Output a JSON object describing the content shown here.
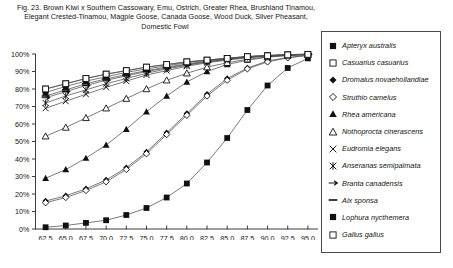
{
  "caption": {
    "line1": "Fig. 23.  Brown Kiwi x Southern Cassowary, Emu, Ostrich, Greater Rhea, Brushland Tinamou,",
    "line2": "Elegant Crested-Tinamou, Magpie Goose, Canada Goose, Wood Duck, Silver Pheasant,",
    "line3": "Domestic Fowl"
  },
  "colors": {
    "ink": "#141414",
    "axis": "#3d3d3d",
    "line": "#4f4f4f",
    "marker_fill": "#101010",
    "marker_open": "#ffffff",
    "legend_border": "#4a4a4a"
  },
  "chart_data": {
    "type": "line",
    "title": "Fig. 23.  Brown Kiwi x Southern Cassowary, Emu, Ostrich, Greater Rhea, Brushland Tinamou, Elegant Crested-Tinamou, Magpie Goose, Canada Goose, Wood Duck, Silver Pheasant, Domestic Fowl",
    "xlabel": "",
    "ylabel": "",
    "xlim": [
      61.25,
      96.25
    ],
    "ylim": [
      0,
      100
    ],
    "grid": false,
    "legend_position": "right",
    "y_tick_labels": [
      "0%",
      "10%",
      "20%",
      "30%",
      "40%",
      "50%",
      "60%",
      "70%",
      "80%",
      "90%",
      "100%"
    ],
    "y_ticks": [
      0,
      10,
      20,
      30,
      40,
      50,
      60,
      70,
      80,
      90,
      100
    ],
    "x_tick_labels": [
      "62.5",
      "65.0",
      "67.5",
      "70.0",
      "72.5",
      "75.0",
      "77.5",
      "80.0",
      "82.5",
      "85.0",
      "87.5",
      "90.0",
      "92.5",
      "95.0"
    ],
    "x": [
      62.5,
      65.0,
      67.5,
      70.0,
      72.5,
      75.0,
      77.5,
      80.0,
      82.5,
      85.0,
      87.5,
      90.0,
      92.5,
      95.0
    ],
    "series": [
      {
        "name": "Apteryx australis",
        "marker": "filled-square",
        "values": [
          1,
          2,
          3.5,
          5,
          8,
          12,
          18,
          26,
          38,
          52,
          68,
          82,
          92,
          97.5
        ]
      },
      {
        "name": "Casuarius casuarius",
        "marker": "open-square",
        "values": [
          80,
          83,
          86,
          88.5,
          90.5,
          92.5,
          94,
          95.5,
          96.5,
          97.5,
          98.5,
          99,
          99.5,
          99.8
        ]
      },
      {
        "name": "Dromaius novaehollandiae",
        "marker": "filled-diamond",
        "values": [
          16,
          19,
          23,
          28,
          35,
          44,
          55,
          66,
          77,
          86,
          92,
          96,
          98,
          99.3
        ]
      },
      {
        "name": "Struthio camelus",
        "marker": "open-diamond",
        "values": [
          15,
          18,
          22,
          27,
          34,
          43,
          54,
          65,
          76,
          85,
          91.5,
          95.5,
          97.8,
          99.2
        ]
      },
      {
        "name": "Rhea americana",
        "marker": "filled-triangle",
        "values": [
          29,
          34,
          40.5,
          48,
          57,
          67,
          76,
          84,
          90,
          94,
          96.5,
          98.2,
          99.2,
          99.6
        ]
      },
      {
        "name": "Nothoprocta cinerascens",
        "marker": "open-triangle",
        "values": [
          53,
          58,
          63.5,
          69,
          74.5,
          80,
          85,
          89,
          92.5,
          95,
          97,
          98.3,
          99.2,
          99.6
        ]
      },
      {
        "name": "Eudromia elegans",
        "marker": "x-cross",
        "values": [
          69,
          73,
          77,
          81,
          84.5,
          88,
          90.5,
          93,
          95,
          96.5,
          97.8,
          98.7,
          99.3,
          99.7
        ]
      },
      {
        "name": "Anseranas semipalmata",
        "marker": "star-cross",
        "values": [
          72,
          76,
          79.5,
          83,
          86,
          89,
          91.5,
          93.5,
          95.5,
          97,
          98.2,
          99,
          99.5,
          99.8
        ]
      },
      {
        "name": "Branta canadensis",
        "marker": "dash-arrow",
        "values": [
          75,
          78.5,
          82,
          85,
          87.5,
          90,
          92,
          94,
          95.5,
          97,
          98.2,
          99,
          99.5,
          99.8
        ]
      },
      {
        "name": "Aix sponsa",
        "marker": "dash",
        "values": [
          76,
          79.5,
          83,
          85.8,
          88.2,
          90.5,
          92.5,
          94.3,
          96,
          97.3,
          98.4,
          99.1,
          99.6,
          99.9
        ]
      },
      {
        "name": "Lophura nycthemera",
        "marker": "filled-square",
        "values": [
          78,
          81.5,
          84.5,
          87,
          89.5,
          91.5,
          93.3,
          95,
          96.5,
          97.6,
          98.6,
          99.2,
          99.6,
          99.9
        ]
      },
      {
        "name": "Gallus gallus",
        "marker": "open-square",
        "values": [
          80,
          83,
          86,
          88.5,
          90.5,
          92.5,
          94,
          95.5,
          96.5,
          97.5,
          98.5,
          99,
          99.5,
          99.8
        ]
      }
    ],
    "legend_entries": [
      {
        "label": "Apteryx australis",
        "marker": "filled-square"
      },
      {
        "label": "Casuarius casuarius",
        "marker": "open-square"
      },
      {
        "label": "Dromaius novaehollandiae",
        "marker": "filled-diamond"
      },
      {
        "label": "Struthio camelus",
        "marker": "open-diamond"
      },
      {
        "label": "Rhea americana",
        "marker": "filled-triangle"
      },
      {
        "label": "Nothoprocta cinerascens",
        "marker": "open-triangle"
      },
      {
        "label": "Eudromia elegans",
        "marker": "x-cross"
      },
      {
        "label": "Anseranas semipalmata",
        "marker": "star-cross"
      },
      {
        "label": "Branta canadensis",
        "marker": "dash-arrow"
      },
      {
        "label": "Aix sponsa",
        "marker": "dash"
      },
      {
        "label": "Lophura nycthemera",
        "marker": "filled-square"
      },
      {
        "label": "Gallus gallus",
        "marker": "open-square"
      }
    ]
  }
}
